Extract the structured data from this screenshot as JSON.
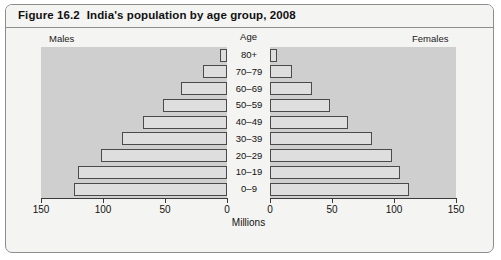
{
  "figure": {
    "number": "Figure 16.2",
    "title": "India's population by age group, 2008"
  },
  "labels": {
    "males": "Males",
    "females": "Females",
    "age_header": "Age",
    "x_axis_title": "Millions"
  },
  "chart_data": {
    "type": "bar",
    "subtype": "population-pyramid",
    "title": "India's population by age group, 2008",
    "xlabel": "Millions",
    "ylabel": "Age",
    "grid": false,
    "legend": "none",
    "axis_max": 150,
    "axis_ticks": [
      150,
      100,
      50,
      0
    ],
    "axis_ticks_right": [
      0,
      50,
      100,
      150
    ],
    "categories": [
      "80+",
      "70–79",
      "60–69",
      "50–59",
      "40–49",
      "30–39",
      "20–29",
      "10–19",
      "0–9"
    ],
    "series": [
      {
        "name": "Males",
        "side": "left",
        "values": [
          6,
          19,
          37,
          52,
          68,
          85,
          102,
          120,
          123
        ]
      },
      {
        "name": "Females",
        "side": "right",
        "values": [
          6,
          18,
          34,
          48,
          63,
          82,
          98,
          105,
          112
        ]
      }
    ]
  },
  "colors": {
    "bar_fill": "#dedede",
    "bar_stroke": "#4a4a4a",
    "panel_background": "#cfcfcf",
    "card_background": "#f4f4f2",
    "border": "#8d8d8d"
  }
}
